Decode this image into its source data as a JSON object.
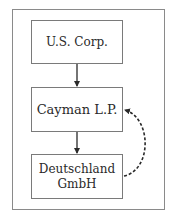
{
  "diagram": {
    "nodes": [
      {
        "id": "us-corp",
        "lines": [
          "U.S. Corp."
        ]
      },
      {
        "id": "cayman-lp",
        "lines": [
          "Cayman L.P."
        ]
      },
      {
        "id": "deutschland-gmbh",
        "lines": [
          "Deutschland",
          "GmbH"
        ]
      }
    ],
    "edges": [
      {
        "from": "us-corp",
        "to": "cayman-lp",
        "style": "solid"
      },
      {
        "from": "cayman-lp",
        "to": "deutschland-gmbh",
        "style": "solid"
      },
      {
        "from": "deutschland-gmbh",
        "to": "cayman-lp",
        "style": "dashed-curved"
      }
    ],
    "colors": {
      "line": "#2a2a2a",
      "border": "#7a7a7a",
      "frame": "#8a8a8a"
    }
  }
}
